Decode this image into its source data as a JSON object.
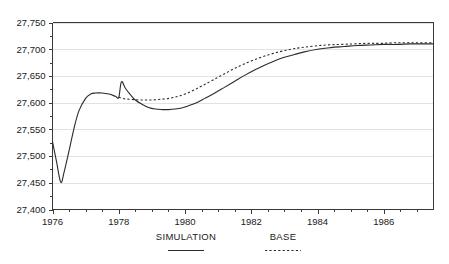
{
  "chart_data": {
    "type": "line",
    "title": "",
    "subtitle": "",
    "xlabel": "",
    "ylabel": "",
    "xlim": [
      1976,
      1987.5
    ],
    "ylim": [
      27400,
      27750
    ],
    "grid": true,
    "legend_position": "bottom",
    "y_ticks": [
      27400,
      27450,
      27500,
      27550,
      27600,
      27650,
      27700,
      27750
    ],
    "y_tick_labels": [
      "27,400",
      "27,450",
      "27,500",
      "27,550",
      "27,600",
      "27,650",
      "27,700",
      "27,750"
    ],
    "x_ticks": [
      1976,
      1978,
      1980,
      1982,
      1984,
      1986
    ],
    "x_tick_labels": [
      "1976",
      "1978",
      "1980",
      "1982",
      "1984",
      "1986"
    ],
    "x_minor_step": 0.5,
    "series": [
      {
        "name": "SIMULATION",
        "style": "solid",
        "color": "#2b2b2b",
        "x": [
          1976.0,
          1976.12,
          1976.25,
          1976.35,
          1976.5,
          1976.65,
          1976.8,
          1977.0,
          1977.15,
          1977.3,
          1977.5,
          1977.7,
          1977.9,
          1978.0,
          1978.08,
          1978.2,
          1978.35,
          1978.5,
          1978.7,
          1978.9,
          1979.1,
          1979.3,
          1979.5,
          1979.7,
          1979.9,
          1980.1,
          1980.35,
          1980.6,
          1980.9,
          1981.2,
          1981.5,
          1981.8,
          1982.1,
          1982.4,
          1982.7,
          1983.0,
          1983.3,
          1983.6,
          1984.0,
          1984.4,
          1984.8,
          1985.2,
          1985.6,
          1986.0,
          1986.4,
          1986.8,
          1987.2,
          1987.5
        ],
        "y": [
          27527,
          27490,
          27451,
          27470,
          27510,
          27552,
          27585,
          27608,
          27616,
          27618,
          27618,
          27616,
          27612,
          27610,
          27639,
          27627,
          27615,
          27605,
          27597,
          27591,
          27588,
          27587,
          27587,
          27588,
          27590,
          27594,
          27600,
          27608,
          27618,
          27629,
          27640,
          27651,
          27661,
          27670,
          27678,
          27685,
          27690,
          27695,
          27700,
          27703,
          27705,
          27707,
          27708,
          27709,
          27709,
          27710,
          27710,
          27710
        ]
      },
      {
        "name": "BASE",
        "style": "dotted",
        "color": "#2b2b2b",
        "x": [
          1978.0,
          1978.2,
          1978.4,
          1978.6,
          1978.8,
          1979.0,
          1979.2,
          1979.4,
          1979.6,
          1979.8,
          1980.0,
          1980.25,
          1980.5,
          1980.8,
          1981.1,
          1981.4,
          1981.7,
          1982.0,
          1982.3,
          1982.6,
          1982.9,
          1983.2,
          1983.5,
          1983.9,
          1984.3,
          1984.7,
          1985.1,
          1985.5,
          1985.9,
          1986.3,
          1986.7,
          1987.1,
          1987.5
        ],
        "y": [
          27610,
          27607,
          27606,
          27605,
          27605,
          27605,
          27606,
          27607,
          27609,
          27612,
          27616,
          27623,
          27631,
          27641,
          27651,
          27661,
          27670,
          27678,
          27685,
          27691,
          27696,
          27700,
          27703,
          27706,
          27708,
          27709,
          27710,
          27711,
          27711,
          27712,
          27712,
          27712,
          27712
        ]
      }
    ],
    "legend": [
      {
        "label": "SIMULATION",
        "style": "solid"
      },
      {
        "label": "BASE",
        "style": "dotted"
      }
    ]
  },
  "colors": {
    "line": "#2b2b2b",
    "grid": "#e2e2e2",
    "axis": "#3a3a3a",
    "background": "#ffffff",
    "text": "#1a1a1a"
  }
}
